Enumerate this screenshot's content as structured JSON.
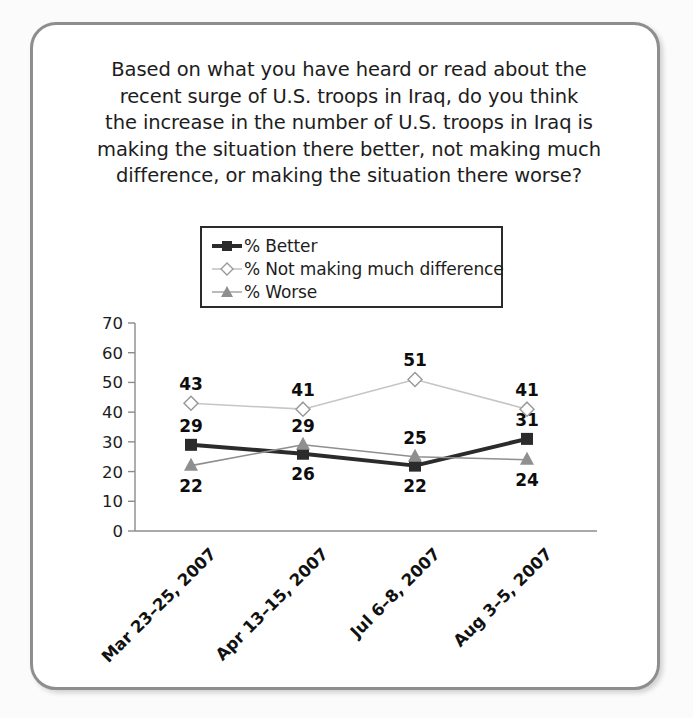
{
  "question": {
    "lines": [
      "Based on what you have heard or read about the",
      "recent surge of U.S. troops in Iraq, do you think",
      "the increase in the number of U.S. troops in Iraq is",
      "making the situation there better, not making much",
      "difference, or making the situation there worse?"
    ],
    "full_text": "Based on what you have heard or read about the recent surge of U.S. troops in Iraq, do you think the increase in the number of U.S. troops in Iraq is making the situation there better, not making much difference, or making the situation there worse?"
  },
  "legend": {
    "items": [
      {
        "label": "% Better",
        "marker": "square-marker",
        "color": "#2b2b2b"
      },
      {
        "label": "% Not making much difference",
        "marker": "diamond-marker",
        "color": "#bdbdbd"
      },
      {
        "label": "% Worse",
        "marker": "triangle-marker",
        "color": "#808080"
      }
    ]
  },
  "chart_data": {
    "type": "line",
    "xlabel": "",
    "ylabel": "",
    "categories": [
      "Mar 23–25, 2007",
      "Apr 13–15, 2007",
      "Jul 6–8, 2007",
      "Aug 3–5, 2007"
    ],
    "ylim": [
      0,
      70
    ],
    "yticks": [
      0,
      10,
      20,
      30,
      40,
      50,
      60,
      70
    ],
    "ytick_labels": [
      "0",
      "10",
      "20",
      "30",
      "40",
      "50",
      "60",
      "70"
    ],
    "grid": false,
    "legend_position": "above-plot",
    "series": [
      {
        "name": "% Better",
        "marker": "square-marker",
        "color": "#2b2b2b",
        "line_width": 4,
        "values": [
          29,
          26,
          22,
          31
        ],
        "label_position": [
          "above",
          "below",
          "below",
          "above"
        ]
      },
      {
        "name": "% Not making much difference",
        "marker": "diamond-marker",
        "color": "#c6c6c6",
        "line_width": 1.6,
        "values": [
          43,
          41,
          51,
          41
        ],
        "label_position": [
          "above",
          "above",
          "above",
          "above"
        ]
      },
      {
        "name": "% Worse",
        "marker": "triangle-marker",
        "color": "#8f8f8f",
        "line_width": 1.6,
        "values": [
          22,
          29,
          25,
          24
        ],
        "label_position": [
          "below",
          "above",
          "above",
          "below"
        ]
      }
    ]
  },
  "colors": {
    "card_border": "#8e8e8e",
    "page_background": "#fbfbfb",
    "card_background": "#ffffff",
    "axis": "#8c8c8c",
    "text": "#1d1d1d"
  }
}
